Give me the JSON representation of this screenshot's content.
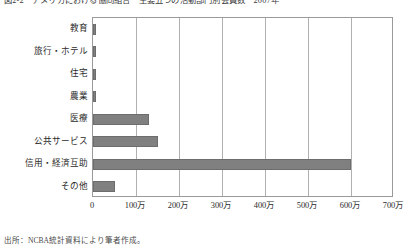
{
  "figure": {
    "title": "図2-2　アメリカにおける協同組合　主要五つの活動部門別会員数　2007年",
    "source_note": "出所：NCBA統計資料により筆者作成。"
  },
  "chart_data": {
    "type": "bar",
    "orientation": "horizontal",
    "title": "図2-2　アメリカにおける協同組合　主要五つの活動部門別会員数　2007年",
    "xlabel": "",
    "ylabel": "",
    "xlim": [
      0,
      7000000
    ],
    "grid": true,
    "legend": "none",
    "unit_label": "（人）",
    "categories": [
      "教育",
      "旅行・ホテル",
      "住宅",
      "農業",
      "医療",
      "公共サービス",
      "信用・経済互助",
      "その他"
    ],
    "values": [
      80000,
      80000,
      80000,
      80000,
      1300000,
      1500000,
      6000000,
      500000
    ],
    "value_labels": [
      "8万",
      "8万",
      "8万",
      "8万",
      "130万",
      "150万",
      "600万",
      "50万"
    ],
    "xticks": [
      0,
      1000000,
      2000000,
      3000000,
      4000000,
      5000000,
      6000000,
      7000000
    ],
    "xticklabels": [
      "0",
      "100万",
      "200万",
      "300万",
      "400万",
      "500万",
      "600万",
      "700万"
    ],
    "colors": {
      "bar_fill": "#808080",
      "bar_stroke": "#6d6d6d",
      "axis": "#9a9a9a",
      "grid": "#b0b0b0",
      "text": "#2b2b2b",
      "background": "#ffffff"
    }
  }
}
